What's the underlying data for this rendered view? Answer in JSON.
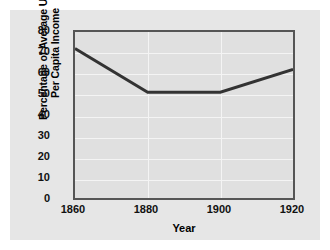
{
  "chart_data": {
    "type": "line",
    "title": "",
    "xlabel": "Year",
    "ylabel_line1": "Percentage of Average U.S.",
    "ylabel_line2": "Per Capita Income",
    "x": [
      1860,
      1880,
      1900,
      1920
    ],
    "values": [
      72,
      51,
      51,
      62
    ],
    "xticks": [
      "1860",
      "1880",
      "1900",
      "1920"
    ],
    "yticks": [
      "0",
      "10",
      "20",
      "30",
      "40",
      "50",
      "60",
      "70",
      "80"
    ],
    "xlim": [
      1860,
      1920
    ],
    "ylim": [
      0,
      80
    ],
    "grid": true,
    "legend": "none",
    "series_color": "#333333",
    "plot_bg_color": "#e0e0e0",
    "panel_bg_color": "#e6e6e6",
    "gridline_color": "#f4f4f4",
    "axis_color": "#555555"
  }
}
